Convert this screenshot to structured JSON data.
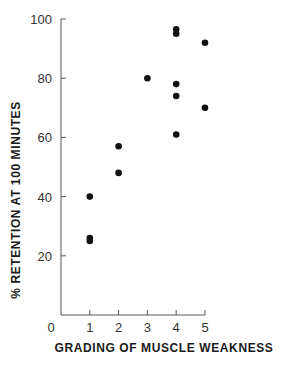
{
  "chart_data": {
    "type": "scatter",
    "title": "",
    "xlabel": "GRADING OF MUSCLE WEAKNESS",
    "ylabel": "% RETENTION AT 100 MINUTES",
    "xlim": [
      0,
      5
    ],
    "ylim": [
      0,
      100
    ],
    "x_ticks": [
      0,
      1,
      2,
      3,
      4,
      5
    ],
    "y_ticks": [
      20,
      40,
      60,
      80,
      100
    ],
    "grid": false,
    "legend": null,
    "points": [
      {
        "x": 1,
        "y": 40
      },
      {
        "x": 1,
        "y": 26
      },
      {
        "x": 1,
        "y": 25
      },
      {
        "x": 2,
        "y": 57
      },
      {
        "x": 2,
        "y": 48
      },
      {
        "x": 3,
        "y": 80
      },
      {
        "x": 4,
        "y": 96.5
      },
      {
        "x": 4,
        "y": 95
      },
      {
        "x": 4,
        "y": 78
      },
      {
        "x": 4,
        "y": 74
      },
      {
        "x": 4,
        "y": 61
      },
      {
        "x": 5,
        "y": 92
      },
      {
        "x": 5,
        "y": 70
      }
    ]
  },
  "labels": {
    "x_axis": "GRADING OF MUSCLE WEAKNESS",
    "y_axis": "% RETENTION AT 100 MINUTES"
  },
  "colors": {
    "axis": "#555555",
    "marker": "#111111",
    "text": "#333333"
  }
}
